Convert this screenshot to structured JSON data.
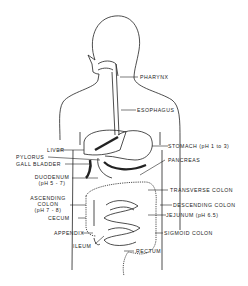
{
  "diagram": {
    "labels": {
      "pharynx": "PHARYNX",
      "esophagus": "ESOPHAGUS",
      "liver": "LIVER",
      "stomach": "STOMACH (pH 1 to 3)",
      "pylorus": "PYLORUS",
      "pancreas": "PANCREAS",
      "gall_bladder": "GALL BLADDER",
      "duodenum": "DUODENUM",
      "duodenum_ph": "(pH 5 - 7)",
      "transverse_colon": "TRANSVERSE COLON",
      "ascending_colon_1": "ASCENDING",
      "ascending_colon_2": "COLON",
      "ascending_colon_ph": "(pH 7 - 8)",
      "descending_colon": "DESCENDING COLON",
      "jejunum": "JEJUNUM (pH 6.5)",
      "cecum": "CECUM",
      "appendix": "APPENDIX",
      "sigmoid_colon": "SIGMOID COLON",
      "ileum": "ILEUM",
      "rectum": "RECTUM"
    }
  }
}
